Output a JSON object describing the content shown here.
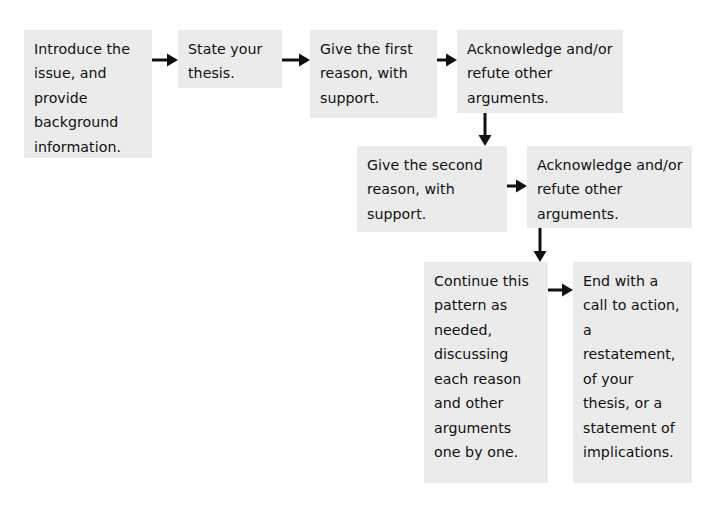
{
  "diagram": {
    "colors": {
      "box_fill": "#ebebeb",
      "box_border": "#3a3a3a",
      "arrow": "#111111",
      "background": "#ffffff",
      "text": "#101010"
    },
    "nodes": [
      {
        "id": "introduce-issue",
        "text": "Introduce the issue, and provide background information.",
        "x": 24,
        "y": 30,
        "w": 128,
        "h": 128
      },
      {
        "id": "state-thesis",
        "text": "State your thesis.",
        "x": 178,
        "y": 30,
        "w": 104,
        "h": 58
      },
      {
        "id": "first-reason",
        "text": "Give the first reason, with support.",
        "x": 310,
        "y": 30,
        "w": 127,
        "h": 88
      },
      {
        "id": "acknowledge-refute-1",
        "text": "Acknowledge and/or refute other arguments.",
        "x": 457,
        "y": 30,
        "w": 166,
        "h": 83
      },
      {
        "id": "second-reason",
        "text": "Give the second reason, with support.",
        "x": 357,
        "y": 146,
        "w": 150,
        "h": 86
      },
      {
        "id": "acknowledge-refute-2",
        "text": "Acknowledge and/or refute other arguments.",
        "x": 527,
        "y": 146,
        "w": 165,
        "h": 82
      },
      {
        "id": "continue-pattern",
        "text": "Continue this pattern as needed, discussing each reason and other arguments one by one.",
        "x": 424,
        "y": 262,
        "w": 124,
        "h": 221
      },
      {
        "id": "end-with-call",
        "text": "End with a call to action, a restatement, of your thesis, or a statement of implications.",
        "x": 573,
        "y": 262,
        "w": 119,
        "h": 221
      }
    ],
    "arrows": [
      {
        "id": "arrow-introduce-to-thesis",
        "from": "introduce-issue",
        "to": "state-thesis",
        "dir": "right",
        "x": 152,
        "y": 60,
        "len": 26
      },
      {
        "id": "arrow-thesis-to-first-reason",
        "from": "state-thesis",
        "to": "first-reason",
        "dir": "right",
        "x": 282,
        "y": 60,
        "len": 28
      },
      {
        "id": "arrow-first-reason-to-ack1",
        "from": "first-reason",
        "to": "acknowledge-refute-1",
        "dir": "right",
        "x": 437,
        "y": 60,
        "len": 20
      },
      {
        "id": "arrow-ack1-to-second-reason",
        "from": "acknowledge-refute-1",
        "to": "second-reason",
        "dir": "down",
        "x": 485,
        "y": 113,
        "len": 33
      },
      {
        "id": "arrow-second-reason-to-ack2",
        "from": "second-reason",
        "to": "acknowledge-refute-2",
        "dir": "right",
        "x": 507,
        "y": 186,
        "len": 20
      },
      {
        "id": "arrow-ack2-to-continue",
        "from": "acknowledge-refute-2",
        "to": "continue-pattern",
        "dir": "down",
        "x": 540,
        "y": 228,
        "len": 34
      },
      {
        "id": "arrow-continue-to-end",
        "from": "continue-pattern",
        "to": "end-with-call",
        "dir": "right",
        "x": 548,
        "y": 290,
        "len": 25
      }
    ]
  }
}
